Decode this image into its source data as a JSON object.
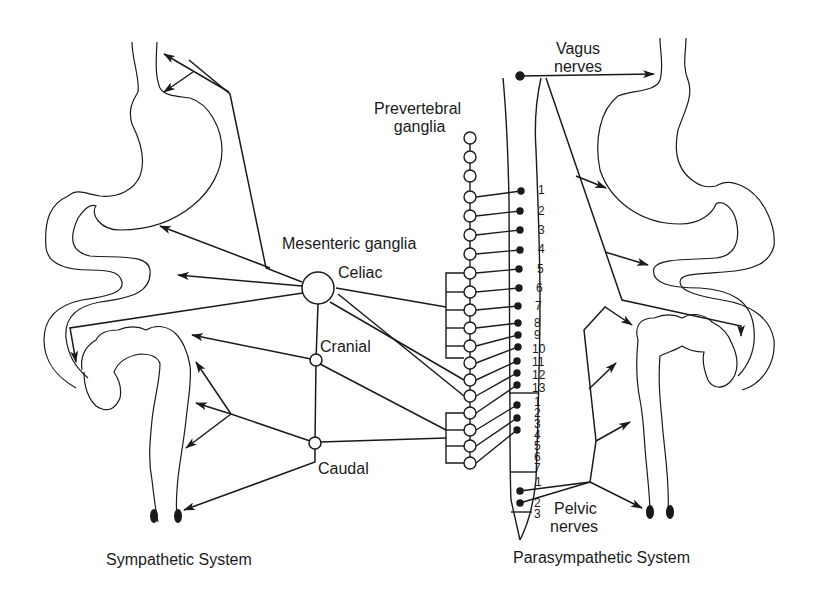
{
  "diagram": {
    "type": "autonomic-nervous-system-anatomy",
    "line_color": "#1a1a1a",
    "background": "#ffffff",
    "captions": {
      "left": "Sympathetic System",
      "right": "Parasympathetic System"
    },
    "labels": {
      "vagus": [
        "Vagus",
        "nerves"
      ],
      "prevertebral": [
        "Prevertebral",
        "ganglia"
      ],
      "mesenteric": "Mesenteric ganglia",
      "celiac": "Celiac",
      "cranial": "Cranial",
      "caudal": "Caudal",
      "pelvic": [
        "Pelvic",
        "nerves"
      ]
    },
    "spinal_segments": {
      "thoracic": [
        "1",
        "2",
        "3",
        "4",
        "5",
        "6",
        "7",
        "8",
        "9",
        "10",
        "11",
        "12",
        "13"
      ],
      "lumbar": [
        "1",
        "2",
        "3",
        "4",
        "5",
        "6",
        "7"
      ],
      "sacral": [
        "1",
        "2",
        "3"
      ]
    },
    "organs": {
      "left": [
        "stomach",
        "small-intestine",
        "colon",
        "rectum"
      ],
      "right": [
        "stomach",
        "small-intestine",
        "colon",
        "rectum"
      ]
    }
  }
}
